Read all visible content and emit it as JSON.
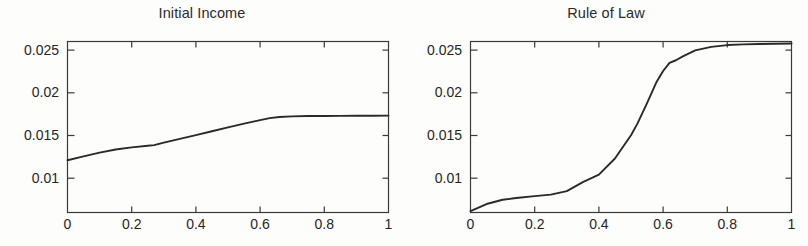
{
  "figure": {
    "background_color": "#fdfdfc",
    "axis_color": "#3a3a3a",
    "line_color": "#2a2a2a",
    "text_color": "#262626"
  },
  "panels": [
    {
      "id": "initial-income",
      "title": "Initial Income",
      "x_ticks": [
        "0",
        "0.2",
        "0.4",
        "0.6",
        "0.8",
        "1"
      ],
      "y_ticks": [
        "0.01",
        "0.015",
        "0.02",
        "0.025"
      ]
    },
    {
      "id": "rule-of-law",
      "title": "Rule of Law",
      "x_ticks": [
        "0",
        "0.2",
        "0.4",
        "0.6",
        "0.8",
        "1"
      ],
      "y_ticks": [
        "0.01",
        "0.015",
        "0.02",
        "0.025"
      ]
    }
  ],
  "chart_data": [
    {
      "type": "line",
      "title": "Initial Income",
      "xlabel": "",
      "ylabel": "",
      "xlim": [
        0,
        1
      ],
      "ylim": [
        0.00695,
        0.0261
      ],
      "xticks": [
        0,
        0.2,
        0.4,
        0.6,
        0.8,
        1
      ],
      "xticklabels": [
        "0",
        "0.2",
        "0.4",
        "0.6",
        "0.8",
        "1"
      ],
      "yticks": [
        0.01,
        0.015,
        0.02,
        0.025
      ],
      "yticklabels": [
        "0.01",
        "0.015",
        "0.02",
        "0.025"
      ],
      "grid": false,
      "legend": null,
      "series": [
        {
          "name": "Initial Income",
          "x": [
            0.0,
            0.05,
            0.1,
            0.15,
            0.2,
            0.25,
            0.27,
            0.3,
            0.35,
            0.4,
            0.45,
            0.5,
            0.55,
            0.6,
            0.63,
            0.66,
            0.7,
            0.75,
            0.8,
            0.85,
            0.9,
            0.95,
            1.0
          ],
          "y": [
            0.0128,
            0.01323,
            0.01365,
            0.014,
            0.01424,
            0.01442,
            0.0145,
            0.01478,
            0.0152,
            0.01562,
            0.01605,
            0.01648,
            0.0169,
            0.0173,
            0.01752,
            0.01765,
            0.01772,
            0.01775,
            0.01776,
            0.01777,
            0.01778,
            0.01779,
            0.0178
          ]
        }
      ]
    },
    {
      "type": "line",
      "title": "Rule of Law",
      "xlabel": "",
      "ylabel": "",
      "xlim": [
        0,
        1
      ],
      "ylim": [
        0.00695,
        0.0261
      ],
      "xticks": [
        0,
        0.2,
        0.4,
        0.6,
        0.8,
        1
      ],
      "xticklabels": [
        "0",
        "0.2",
        "0.4",
        "0.6",
        "0.8",
        "1"
      ],
      "yticks": [
        0.01,
        0.015,
        0.02,
        0.025
      ],
      "yticklabels": [
        "0.01",
        "0.015",
        "0.02",
        "0.025"
      ],
      "grid": false,
      "legend": null,
      "series": [
        {
          "name": "Rule of Law",
          "x": [
            0.0,
            0.05,
            0.1,
            0.15,
            0.2,
            0.25,
            0.3,
            0.35,
            0.38,
            0.4,
            0.45,
            0.5,
            0.52,
            0.55,
            0.58,
            0.6,
            0.62,
            0.64,
            0.66,
            0.7,
            0.75,
            0.8,
            0.85,
            0.9,
            0.95,
            1.0
          ],
          "y": [
            0.0071,
            0.0079,
            0.00838,
            0.0086,
            0.00878,
            0.00895,
            0.00935,
            0.01035,
            0.01085,
            0.0112,
            0.013,
            0.0156,
            0.0169,
            0.0192,
            0.0216,
            0.0228,
            0.0237,
            0.024,
            0.0244,
            0.0251,
            0.0255,
            0.0257,
            0.02578,
            0.02582,
            0.02585,
            0.02588
          ]
        }
      ]
    }
  ]
}
